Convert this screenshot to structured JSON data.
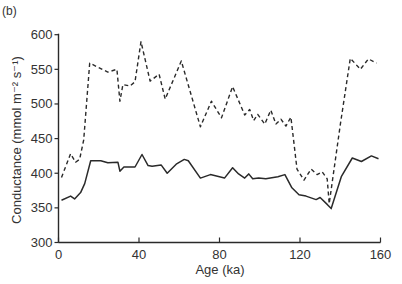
{
  "panel_label": "(b)",
  "chart_data": {
    "type": "line",
    "title": "",
    "panel": "(b)",
    "xlabel": "Age (ka)",
    "ylabel": "Conductance (mmol m⁻² s⁻¹)",
    "xlim": [
      0,
      160
    ],
    "ylim": [
      300,
      600
    ],
    "xticks": [
      0,
      40,
      80,
      120,
      160
    ],
    "yticks": [
      300,
      350,
      400,
      450,
      500,
      550,
      600
    ],
    "grid": false,
    "legend": null,
    "series": [
      {
        "name": "dashed",
        "style": "dashed",
        "x": [
          1.5,
          6,
          8.5,
          10.5,
          12.5,
          15.5,
          24.5,
          29,
          30.5,
          32,
          35.5,
          38,
          41,
          45.5,
          50,
          53,
          61,
          70.5,
          76,
          81,
          86.5,
          92.5,
          95,
          97,
          99,
          102.5,
          105.5,
          108,
          110.5,
          113,
          115.5,
          118.5,
          122,
          125.5,
          128.5,
          131,
          133.5,
          134.5,
          140,
          145,
          150,
          154,
          158
        ],
        "y": [
          394,
          428,
          416,
          420,
          448,
          559,
          546,
          550,
          504,
          528,
          526,
          532,
          590,
          533,
          543,
          507,
          562,
          467,
          504,
          480,
          525,
          484,
          492,
          476,
          485,
          471,
          491,
          471,
          478,
          468,
          481,
          406,
          390,
          406,
          398,
          402,
          392,
          356,
          470,
          566,
          550,
          565,
          559
        ]
      },
      {
        "name": "solid",
        "style": "solid",
        "x": [
          1.5,
          6,
          8,
          11,
          13,
          16,
          21,
          24.5,
          29.5,
          30.5,
          32.5,
          38,
          41.5,
          44.5,
          46.5,
          51,
          54,
          58.5,
          62.5,
          64.5,
          70.5,
          75.5,
          82.5,
          86.5,
          89.5,
          92.5,
          94.5,
          96.5,
          99.5,
          103,
          109,
          112.5,
          116,
          119.5,
          123,
          128,
          130,
          133.5,
          135.5,
          140.5,
          146,
          150.5,
          155.5,
          159
        ],
        "y": [
          361,
          367,
          363,
          372,
          385,
          418,
          418,
          415,
          416,
          403,
          409,
          409,
          427,
          411,
          410,
          412,
          400,
          413,
          420,
          418,
          393,
          398,
          393,
          408,
          399,
          393,
          399,
          392,
          393,
          392,
          395,
          398,
          379,
          369,
          367,
          362,
          365,
          355,
          349,
          395,
          422,
          417,
          425,
          421
        ]
      }
    ]
  }
}
